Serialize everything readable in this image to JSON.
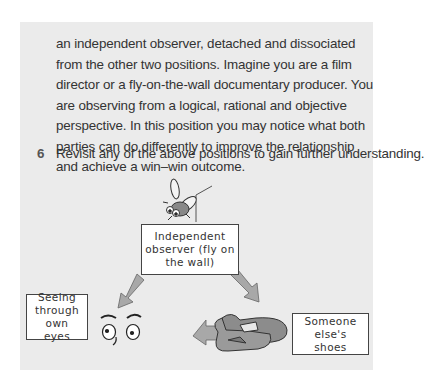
{
  "paragraph": {
    "text": "an independent observer, detached and dissociated from the other two positions. Imagine you are a film director or a fly-on-the-wall documentary producer. You are observing from a logical, rational and objective perspective. In this position you may notice what both parties can do differently to improve the relationship and achieve a win–win outcome."
  },
  "list_item": {
    "number": "6",
    "text": "Revisit any of the above positions to gain further understanding."
  },
  "diagram": {
    "top_label": "Independent observer (fly on the wall)",
    "left_label": "Seeing through own eyes",
    "right_label": "Someone else's shoes",
    "icons": [
      "fly-icon",
      "eyes-icon",
      "shoes-icon",
      "arrow-icon"
    ],
    "colors": {
      "panel": "#ebebeb",
      "arrow": "#a8a8a8",
      "shoes": "#8c8c8c"
    }
  }
}
